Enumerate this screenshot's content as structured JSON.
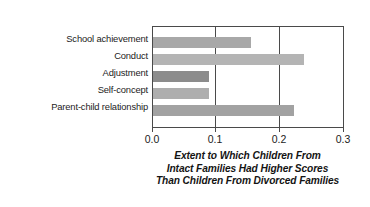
{
  "chart_data": {
    "type": "bar",
    "orientation": "horizontal",
    "title": "",
    "categories": [
      "School achievement",
      "Conduct",
      "Adjustment",
      "Self-concept",
      "Parent-child relationship"
    ],
    "values": [
      0.153,
      0.236,
      0.088,
      0.088,
      0.22
    ],
    "bar_colors": [
      "#a8a8a8",
      "#b4b4b4",
      "#8c8c8c",
      "#aeaeae",
      "#a2a2a2"
    ],
    "xlabel": "Extent to Which Children From Intact Families Had Higher Scores Than Children From Divorced Families",
    "ylabel": "",
    "xlim": [
      0.0,
      0.3
    ],
    "xticks": [
      0.0,
      0.1,
      0.2,
      0.3
    ],
    "xtick_labels": [
      "0.0",
      "0.1",
      "0.2",
      "0.3"
    ],
    "grid": "vertical-at-0.1-and-0.2",
    "legend": "none",
    "caption_lines": [
      "Extent to Which Children From",
      "Intact Families Had Higher Scores",
      "Than Children From Divorced Families"
    ]
  },
  "style": {
    "background": "#ffffff",
    "axis_color": "#4a4a4a",
    "text_color": "#1c1c1c"
  }
}
